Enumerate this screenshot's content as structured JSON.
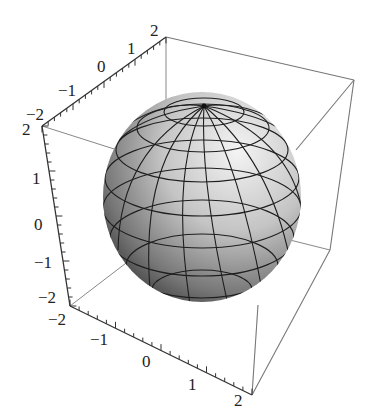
{
  "chart_data": {
    "type": "surface3d",
    "title": "",
    "surface": {
      "shape": "sphere",
      "center": [
        0,
        0,
        0
      ],
      "radius": 1.5,
      "mesh": {
        "latitude_lines": 8,
        "longitude_lines": 16
      },
      "shading": "gray gradient, lit from upper right"
    },
    "axes": {
      "x": {
        "ticks": [
          -2,
          -1,
          0,
          1,
          2
        ],
        "range": [
          -2,
          2
        ],
        "label": ""
      },
      "y": {
        "ticks": [
          -2,
          -1,
          0,
          1,
          2
        ],
        "range": [
          -2,
          2
        ],
        "label": ""
      },
      "z": {
        "ticks": [
          -2,
          -1,
          0,
          1,
          2
        ],
        "range": [
          -2,
          2
        ],
        "label": ""
      }
    },
    "box": true,
    "grid": false,
    "legend": null
  },
  "labels": {
    "top_axis": [
      "−2",
      "−1",
      "0",
      "1",
      "2"
    ],
    "left_axis": [
      "2",
      "1",
      "0",
      "−1",
      "−2"
    ],
    "bottom_axis": [
      "−2",
      "−1",
      "0",
      "1",
      "2"
    ]
  },
  "colors": {
    "box_line": "#777777",
    "axis_line": "#333333",
    "mesh_line": "#1a1a1a",
    "sphere_light": "#f2f2f2",
    "sphere_dark": "#3a3a3a"
  }
}
